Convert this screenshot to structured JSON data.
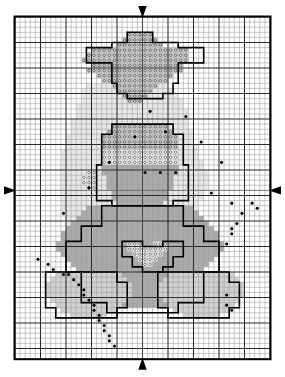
{
  "document": {
    "kind": "cross-stitch-pattern-chart",
    "title": "",
    "background_color": "#ffffff",
    "ink_color": "#000000"
  },
  "grid": {
    "origin_x": 15,
    "origin_y": 17,
    "cell": 5.1,
    "cols": 50,
    "rows": 67,
    "major_every": 5,
    "minor_color": "#9a9a9a",
    "major_color": "#2b2b2b",
    "border_color": "#000000",
    "border_width": 2
  },
  "center_markers": {
    "top": {
      "name": "center-arrow-top",
      "col": 25,
      "direction": "down"
    },
    "bottom": {
      "name": "center-arrow-bottom",
      "col": 25,
      "direction": "up"
    },
    "left": {
      "name": "center-arrow-left",
      "row": 34,
      "direction": "right"
    },
    "right": {
      "name": "center-arrow-right",
      "row": 34,
      "direction": "left"
    }
  },
  "legend_symbols": [
    {
      "key": "open_ring",
      "label": "open circle on white",
      "fill": "#ffffff",
      "ring": true
    },
    {
      "key": "shaded_ring",
      "label": "open circle on light shade",
      "fill": "#d9d9d9",
      "ring": true
    },
    {
      "key": "mid_fill",
      "label": "medium shade",
      "fill": "#a9a9a9",
      "ring": false
    },
    {
      "key": "light_fill",
      "label": "light shade",
      "fill": "#cfcfcf",
      "ring": false
    },
    {
      "key": "halo_fill",
      "label": "pale halo shade",
      "fill": "#e4e4e4",
      "ring": false
    },
    {
      "key": "knot",
      "label": "french knot / backstitch dot",
      "fill": "#000000",
      "ring": false
    }
  ],
  "chart_data": {
    "type": "heatmap",
    "title": "",
    "xlabel": "",
    "ylabel": "",
    "grid": true,
    "legend_position": "none",
    "cols": 50,
    "rows": 67,
    "palette": {
      "halo_fill": "#e7e7e7",
      "light_fill": "#d0d0d0",
      "mid_fill": "#aaaaaa",
      "shaded_ring": "#d6d6d6",
      "open_ring": "#ffffff",
      "knot": "#000000"
    },
    "regions": [
      {
        "name": "halo-glow",
        "symbol": "halo_fill",
        "runs": [
          [
            13,
            50,
            14,
            16
          ],
          [
            14,
            50,
            13,
            18
          ],
          [
            15,
            48,
            13,
            19
          ],
          [
            16,
            47,
            13,
            20
          ],
          [
            17,
            46,
            12,
            21
          ],
          [
            18,
            45,
            12,
            22
          ],
          [
            19,
            44,
            12,
            22
          ],
          [
            20,
            43,
            11,
            23
          ],
          [
            21,
            42,
            11,
            23
          ],
          [
            22,
            41,
            11,
            24
          ],
          [
            23,
            40,
            10,
            25
          ],
          [
            24,
            39,
            10,
            25
          ],
          [
            25,
            38,
            10,
            26
          ],
          [
            26,
            37,
            9,
            27
          ],
          [
            27,
            36,
            9,
            27
          ],
          [
            28,
            35,
            9,
            28
          ],
          [
            29,
            34,
            9,
            28
          ],
          [
            30,
            33,
            9,
            29
          ],
          [
            31,
            32,
            9,
            29
          ],
          [
            32,
            31,
            10,
            28
          ],
          [
            33,
            30,
            10,
            28
          ],
          [
            34,
            29,
            10,
            28
          ],
          [
            35,
            28,
            11,
            27
          ],
          [
            36,
            27,
            11,
            27
          ],
          [
            37,
            26,
            12,
            26
          ],
          [
            38,
            25,
            12,
            26
          ],
          [
            39,
            24,
            13,
            25
          ],
          [
            40,
            23,
            13,
            25
          ],
          [
            41,
            22,
            14,
            24
          ],
          [
            42,
            21,
            15,
            23
          ],
          [
            43,
            20,
            16,
            22
          ],
          [
            44,
            19,
            17,
            21
          ],
          [
            45,
            18,
            18,
            20
          ],
          [
            46,
            17,
            19,
            18
          ],
          [
            47,
            16,
            20,
            17
          ],
          [
            48,
            15,
            21,
            16
          ]
        ]
      },
      {
        "name": "star-halo-top",
        "symbol": "shaded_ring",
        "runs": [
          [
            3,
            3,
            22,
            5
          ],
          [
            4,
            4,
            21,
            7
          ],
          [
            5,
            5,
            20,
            9
          ],
          [
            6,
            6,
            15,
            19
          ],
          [
            7,
            7,
            14,
            20
          ],
          [
            8,
            8,
            13,
            21
          ],
          [
            9,
            9,
            15,
            18
          ],
          [
            10,
            10,
            14,
            19
          ],
          [
            11,
            11,
            16,
            15
          ],
          [
            12,
            12,
            17,
            13
          ],
          [
            13,
            13,
            19,
            9
          ],
          [
            14,
            14,
            20,
            7
          ],
          [
            15,
            15,
            21,
            5
          ],
          [
            16,
            16,
            22,
            3
          ]
        ]
      },
      {
        "name": "head-upper-shaded",
        "symbol": "shaded_ring",
        "runs": [
          [
            21,
            21,
            19,
            11
          ],
          [
            22,
            22,
            18,
            13
          ],
          [
            23,
            23,
            17,
            15
          ],
          [
            24,
            24,
            17,
            15
          ],
          [
            25,
            25,
            17,
            15
          ]
        ]
      },
      {
        "name": "head-lower-open",
        "symbol": "open_ring",
        "runs": [
          [
            26,
            26,
            17,
            15
          ],
          [
            27,
            27,
            17,
            15
          ],
          [
            28,
            28,
            17,
            15
          ]
        ]
      },
      {
        "name": "head-face-mid",
        "symbol": "mid_fill",
        "runs": [
          [
            29,
            29,
            17,
            15
          ],
          [
            30,
            30,
            17,
            15
          ],
          [
            31,
            31,
            18,
            13
          ],
          [
            32,
            32,
            18,
            13
          ],
          [
            33,
            33,
            18,
            13
          ],
          [
            34,
            34,
            19,
            11
          ],
          [
            35,
            35,
            19,
            11
          ],
          [
            36,
            36,
            20,
            9
          ]
        ]
      },
      {
        "name": "ear-left-open",
        "symbol": "open_ring",
        "runs": [
          [
            30,
            30,
            14,
            2
          ],
          [
            31,
            31,
            13,
            3
          ],
          [
            32,
            32,
            13,
            3
          ],
          [
            33,
            33,
            14,
            2
          ]
        ]
      },
      {
        "name": "body-mid",
        "symbol": "mid_fill",
        "runs": [
          [
            37,
            37,
            14,
            21
          ],
          [
            38,
            38,
            13,
            23
          ],
          [
            39,
            39,
            12,
            25
          ],
          [
            40,
            40,
            11,
            27
          ],
          [
            41,
            41,
            10,
            29
          ],
          [
            42,
            42,
            9,
            31
          ],
          [
            43,
            43,
            9,
            31
          ],
          [
            44,
            44,
            8,
            33
          ],
          [
            45,
            45,
            8,
            33
          ],
          [
            46,
            46,
            9,
            31
          ],
          [
            47,
            47,
            10,
            29
          ],
          [
            48,
            48,
            11,
            27
          ],
          [
            49,
            49,
            12,
            25
          ],
          [
            50,
            50,
            13,
            23
          ],
          [
            51,
            51,
            14,
            21
          ],
          [
            52,
            52,
            15,
            19
          ],
          [
            53,
            53,
            16,
            17
          ],
          [
            54,
            54,
            17,
            15
          ],
          [
            55,
            55,
            18,
            13
          ],
          [
            56,
            56,
            19,
            11
          ]
        ]
      },
      {
        "name": "heart-chest-open",
        "symbol": "open_ring",
        "runs": [
          [
            44,
            44,
            22,
            3
          ],
          [
            44,
            44,
            27,
            3
          ],
          [
            45,
            45,
            22,
            8
          ],
          [
            46,
            46,
            23,
            6
          ],
          [
            47,
            47,
            24,
            4
          ],
          [
            48,
            48,
            25,
            2
          ]
        ]
      },
      {
        "name": "paw-left-light",
        "symbol": "light_fill",
        "runs": [
          [
            50,
            50,
            8,
            13
          ],
          [
            51,
            51,
            7,
            15
          ],
          [
            52,
            52,
            6,
            17
          ],
          [
            53,
            53,
            6,
            17
          ],
          [
            54,
            54,
            6,
            17
          ],
          [
            55,
            55,
            7,
            15
          ],
          [
            56,
            56,
            8,
            13
          ],
          [
            57,
            57,
            9,
            11
          ],
          [
            58,
            58,
            11,
            7
          ]
        ]
      },
      {
        "name": "paw-right-light",
        "symbol": "light_fill",
        "runs": [
          [
            50,
            50,
            30,
            13
          ],
          [
            51,
            51,
            29,
            15
          ],
          [
            52,
            52,
            28,
            17
          ],
          [
            53,
            53,
            28,
            17
          ],
          [
            54,
            54,
            28,
            17
          ],
          [
            55,
            55,
            29,
            15
          ],
          [
            56,
            56,
            30,
            13
          ],
          [
            57,
            57,
            31,
            11
          ],
          [
            58,
            58,
            33,
            7
          ]
        ]
      }
    ],
    "outlines": [
      {
        "name": "star-outline",
        "points": "22,3 27,3 27,5 32,5 32,6 37,6 37,9 32,9 32,13 31,13 31,15 29,15 29,16 22,16 22,15 20,15 20,13 19,13 19,9 14,9 14,6 19,6 19,5 22,5"
      },
      {
        "name": "head-outline",
        "points": "19,21 31,21 31,23 33,23 33,29 34,29 34,36 31,36 31,37 19,37 19,36 16,36 16,29 17,29 17,23 19,23"
      },
      {
        "name": "body-outline",
        "points": "17,37 33,37 33,41 37,41 37,44 40,44 40,50 37,50 37,56 32,56 32,58 18,58 18,56 13,56 13,50 10,50 10,44 13,44 13,41 17,41"
      },
      {
        "name": "heart-outline",
        "points": "21,44 25,44 25,45 29,45 29,44 33,44 33,47 31,47 31,49 29,49 29,50 25,50 25,49 23,49 23,47 21,47"
      },
      {
        "name": "paw-left-outline",
        "points": "6,50 20,50 20,52 22,52 22,57 20,57 20,59 8,59 8,57 6,57"
      },
      {
        "name": "paw-right-outline",
        "points": "28,50 42,50 42,52 44,52 44,57 42,57 42,59 30,59 30,57 28,57"
      }
    ],
    "knots": [
      {
        "col": 26,
        "row": 18
      },
      {
        "col": 33,
        "row": 19
      },
      {
        "col": 29,
        "row": 22
      },
      {
        "col": 23,
        "row": 23
      },
      {
        "col": 36,
        "row": 24
      },
      {
        "col": 18,
        "row": 28
      },
      {
        "col": 40,
        "row": 28
      },
      {
        "col": 25,
        "row": 30
      },
      {
        "col": 28,
        "row": 30
      },
      {
        "col": 31,
        "row": 30
      },
      {
        "col": 14,
        "row": 33
      },
      {
        "col": 38,
        "row": 34
      },
      {
        "col": 42,
        "row": 36
      },
      {
        "col": 9,
        "row": 38
      },
      {
        "col": 46,
        "row": 36
      },
      {
        "col": 47,
        "row": 37
      },
      {
        "col": 44,
        "row": 38
      },
      {
        "col": 43,
        "row": 40
      },
      {
        "col": 42,
        "row": 41
      },
      {
        "col": 42,
        "row": 42
      },
      {
        "col": 41,
        "row": 44
      },
      {
        "col": 4,
        "row": 47
      },
      {
        "col": 6,
        "row": 48
      },
      {
        "col": 7,
        "row": 49
      },
      {
        "col": 9,
        "row": 50
      },
      {
        "col": 10,
        "row": 50
      },
      {
        "col": 11,
        "row": 51
      },
      {
        "col": 12,
        "row": 52
      },
      {
        "col": 13,
        "row": 53
      },
      {
        "col": 13,
        "row": 54
      },
      {
        "col": 14,
        "row": 55
      },
      {
        "col": 15,
        "row": 56
      },
      {
        "col": 15,
        "row": 57
      },
      {
        "col": 16,
        "row": 58
      },
      {
        "col": 16,
        "row": 59
      },
      {
        "col": 17,
        "row": 60
      },
      {
        "col": 17,
        "row": 61
      },
      {
        "col": 18,
        "row": 62
      },
      {
        "col": 18,
        "row": 63
      },
      {
        "col": 19,
        "row": 64
      },
      {
        "col": 41,
        "row": 54
      },
      {
        "col": 41,
        "row": 56
      },
      {
        "col": 42,
        "row": 57
      }
    ]
  }
}
